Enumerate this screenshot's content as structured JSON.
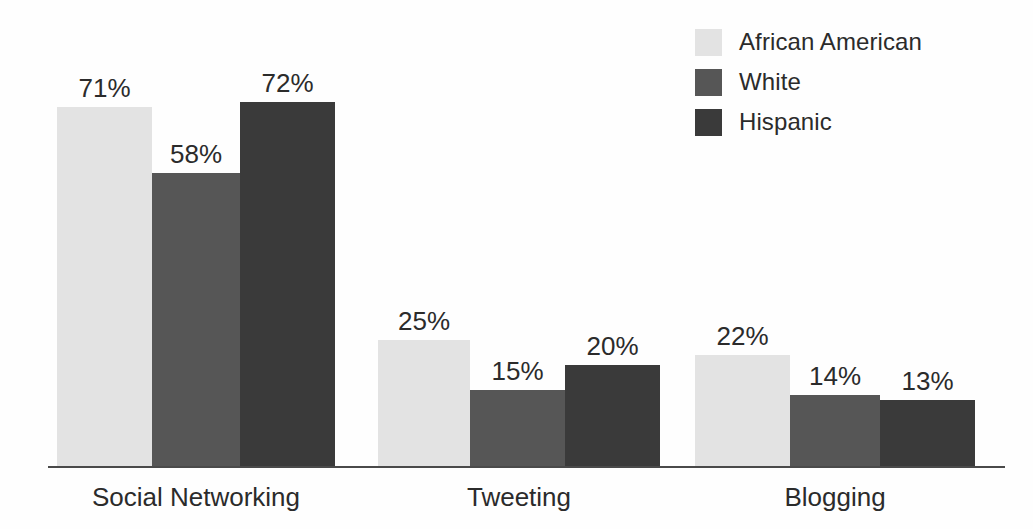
{
  "chart_data": {
    "type": "bar",
    "title": "",
    "subtitle": "",
    "xlabel": "",
    "ylabel": "",
    "ylim": [
      0,
      80
    ],
    "grid": false,
    "legend_position": "top-right",
    "value_suffix": "%",
    "categories": [
      "Social Networking",
      "Tweeting",
      "Blogging"
    ],
    "series": [
      {
        "name": "African American",
        "color": "#e3e3e3",
        "values": [
          71,
          25,
          22
        ],
        "labels": [
          "71%",
          "25%",
          "22%"
        ]
      },
      {
        "name": "White",
        "color": "#565656",
        "values": [
          58,
          15,
          14
        ],
        "labels": [
          "58%",
          "15%",
          "14%"
        ]
      },
      {
        "name": "Hispanic",
        "color": "#3a3a3a",
        "values": [
          72,
          20,
          13
        ],
        "labels": [
          "72%",
          "20%",
          "13%"
        ]
      }
    ]
  },
  "legend": {
    "items": [
      {
        "label": "African American",
        "color": "#e3e3e3"
      },
      {
        "label": "White",
        "color": "#565656"
      },
      {
        "label": "Hispanic",
        "color": "#3a3a3a"
      }
    ]
  },
  "axis": {
    "labels": [
      "Social Networking",
      "Tweeting",
      "Blogging"
    ],
    "line_color": "#4a4a4a"
  },
  "groups": [
    {
      "label": "Social Networking",
      "bars": [
        {
          "series": "African American",
          "value": 71,
          "label": "71%",
          "color": "#e3e3e3"
        },
        {
          "series": "White",
          "value": 58,
          "label": "58%",
          "color": "#565656"
        },
        {
          "series": "Hispanic",
          "value": 72,
          "label": "72%",
          "color": "#3a3a3a"
        }
      ]
    },
    {
      "label": "Tweeting",
      "bars": [
        {
          "series": "African American",
          "value": 25,
          "label": "25%",
          "color": "#e3e3e3"
        },
        {
          "series": "White",
          "value": 15,
          "label": "15%",
          "color": "#565656"
        },
        {
          "series": "Hispanic",
          "value": 20,
          "label": "20%",
          "color": "#3a3a3a"
        }
      ]
    },
    {
      "label": "Blogging",
      "bars": [
        {
          "series": "African American",
          "value": 22,
          "label": "22%",
          "color": "#e3e3e3"
        },
        {
          "series": "White",
          "value": 14,
          "label": "14%",
          "color": "#565656"
        },
        {
          "series": "Hispanic",
          "value": 13,
          "label": "13%",
          "color": "#3a3a3a"
        }
      ]
    }
  ]
}
